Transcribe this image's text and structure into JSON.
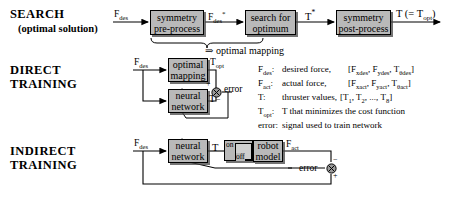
{
  "diagram": {
    "title_rows": [
      {
        "id": "search",
        "title": "SEARCH",
        "subtitle": "(optimal solution)"
      },
      {
        "id": "direct",
        "title": "DIRECT",
        "subtitle": "TRAINING"
      },
      {
        "id": "indirect",
        "title": "INDIRECT",
        "subtitle": "TRAINING"
      }
    ]
  },
  "search_row": {
    "input_label_html": "F<sub>des</sub>",
    "box1_line1": "symmetry",
    "box1_line2": "pre-process",
    "mid_label_html": "F<sub>des</sub><sup>*</sup>",
    "box2_line1": "search for",
    "box2_line2": "optimum",
    "mid2_label_html": "T<sup>*</sup>",
    "box3_line1": "symmetry",
    "box3_line2": "post-process",
    "output_label_html": "T (= T<sub>opt</sub>)",
    "brace_note": "⇒ optimal mapping"
  },
  "direct_row": {
    "input_label_html": "F<sub>des</sub>",
    "box1_line1": "optimal",
    "box1_line2": "mapping",
    "box2_line1": "neural",
    "box2_line2": "network",
    "top_signal_html": "T<sub>opt</sub>",
    "bottom_signal_html": "T",
    "sum_plus": "+",
    "sum_minus": "−",
    "error_label": "error"
  },
  "indirect_row": {
    "input_label_html": "F<sub>des</sub>",
    "box1_line1": "neural",
    "box1_line2": "network",
    "signal_html": "T",
    "switch_on": "on",
    "switch_off": "off",
    "box2_line1": "robot",
    "box2_line2": "model",
    "output_label_html": "F<sub>act</sub>",
    "sum_minus": "−",
    "sum_plus": "+",
    "error_label": "error"
  },
  "legend": {
    "entries": [
      {
        "key": "Fdes:",
        "key_html": "F<sub>des</sub>:",
        "desc": "desired force,",
        "extra_html": "[F<sub>xdes</sub>, F<sub>ydes</sub>, T<sub>θdes</sub>]"
      },
      {
        "key": "Fact:",
        "key_html": "F<sub>act</sub>:",
        "desc": "actual force,",
        "extra_html": "[F<sub>xact</sub>, F<sub>yact</sub>, T<sub>θact</sub>]"
      },
      {
        "key": "T:",
        "key_html": "T:",
        "desc": "thruster values,",
        "extra_html": "[T<sub>1</sub>, T<sub>2</sub>, ..., T<sub>8</sub>]"
      },
      {
        "key": "Topt:",
        "key_html": "T<sub>opt</sub>:",
        "desc": "T that minimizes the cost function",
        "extra_html": ""
      },
      {
        "key": "error:",
        "key_html": "error:",
        "desc": "signal used to train network",
        "extra_html": ""
      }
    ]
  },
  "colors": {
    "box_fill": "#b9b9b9",
    "line": "#000000",
    "background": "#ffffff"
  }
}
